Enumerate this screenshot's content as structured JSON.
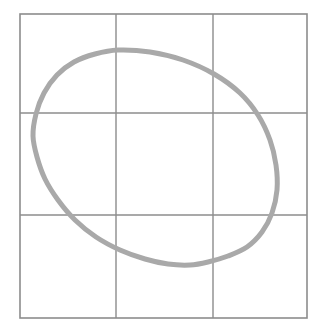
{
  "figure": {
    "background_color": "#ffffff",
    "width": 326,
    "height": 333
  },
  "grid": {
    "name": "three-by-three-grid",
    "stroke_color": "#8c8c8c",
    "stroke_width": 1.4,
    "outer_box": {
      "left": 20,
      "top": 14,
      "right": 307,
      "bottom": 318
    },
    "vertical_lines_x": [
      116,
      213
    ],
    "horizontal_lines_y": [
      113,
      215
    ],
    "rows": 3,
    "columns": 3
  },
  "chart_data": {
    "type": "line",
    "xlabel": "",
    "ylabel": "",
    "grid": true,
    "legend": "none",
    "xlim": [
      20,
      307
    ],
    "ylim": [
      14,
      318
    ],
    "series": [
      {
        "name": "oval-outline",
        "closed": true,
        "color": "#a9a9a9",
        "stroke_width": 5,
        "extrema": {
          "top": [
            118,
            50
          ],
          "right": [
            277,
            190
          ],
          "bottom": [
            190,
            265
          ],
          "left": [
            33,
            155
          ]
        },
        "grid_crossings": {
          "horizontal_y_113": [
            41,
            251
          ],
          "horizontal_y_215": [
            70,
            271
          ],
          "vertical_x_116": [
            50,
            264
          ],
          "vertical_x_213": [
            62,
            262
          ]
        },
        "points": [
          [
            118,
            50
          ],
          [
            150,
            52
          ],
          [
            183,
            60
          ],
          [
            214,
            74
          ],
          [
            240,
            93
          ],
          [
            258,
            115
          ],
          [
            270,
            140
          ],
          [
            276,
            165
          ],
          [
            277,
            190
          ],
          [
            272,
            213
          ],
          [
            262,
            232
          ],
          [
            247,
            247
          ],
          [
            228,
            256
          ],
          [
            208,
            262
          ],
          [
            190,
            265
          ],
          [
            168,
            264
          ],
          [
            145,
            259
          ],
          [
            120,
            250
          ],
          [
            96,
            237
          ],
          [
            75,
            220
          ],
          [
            58,
            200
          ],
          [
            45,
            179
          ],
          [
            37,
            157
          ],
          [
            33,
            136
          ],
          [
            36,
            114
          ],
          [
            44,
            93
          ],
          [
            57,
            75
          ],
          [
            74,
            62
          ],
          [
            95,
            54
          ],
          [
            118,
            50
          ]
        ]
      }
    ]
  },
  "curve": {
    "name": "oval-curve",
    "path": "M 118 50 C 160 50 205 65 238 92 C 264 113 277 150 277 185 C 277 220 262 244 232 256 C 205 267 172 267 140 257 C 104 246 72 222 53 193 C 36 167 31 140 36 115 C 43 84 70 61 100 53 C 106 51 112 50 118 50 Z",
    "stroke_color": "#a9a9a9",
    "stroke_width": 5
  }
}
